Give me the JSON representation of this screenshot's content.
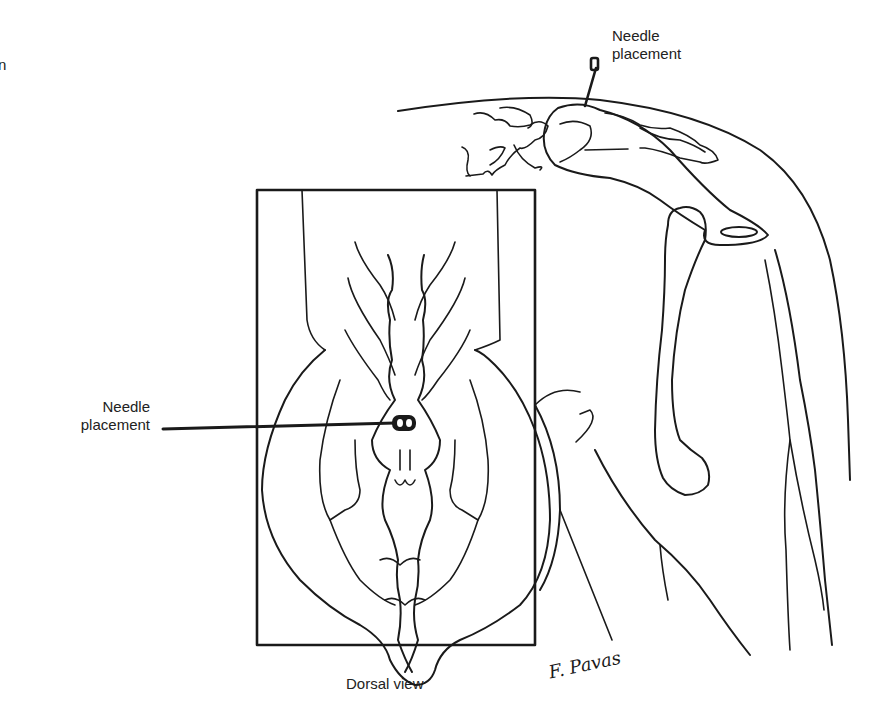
{
  "figure": {
    "edge_text_fragment": "n",
    "labels": {
      "lateral_needle": {
        "line1": "Needle",
        "line2": "placement"
      },
      "dorsal_needle": {
        "line1": "Needle",
        "line2": "placement"
      },
      "caption": "Dorsal view"
    },
    "signature": "F. Pavas",
    "colors": {
      "ink": "#1a1a1a",
      "background": "#ffffff"
    }
  }
}
